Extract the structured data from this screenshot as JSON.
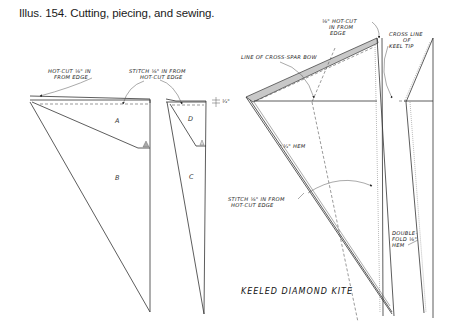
{
  "caption": "Illus. 154. Cutting, piecing, and sewing.",
  "left_diagram": {
    "labels": {
      "hot_cut_1": "HOT-CUT ⅛\" IN",
      "hot_cut_2": "FROM EDGE",
      "stitch_1": "STITCH ⅛\" IN FROM",
      "stitch_2": "HOT-CUT EDGE",
      "dimension": "¼\""
    },
    "pieces": {
      "a": "A",
      "b": "B",
      "c": "C",
      "d": "D"
    }
  },
  "right_diagram": {
    "title": "KEELED DIAMOND KITE",
    "labels": {
      "hot_cut_1": "⅛\" HOT-CUT",
      "hot_cut_2": "IN FROM",
      "hot_cut_3": "EDGE",
      "cross_spar": "LINE OF CROSS-SPAR BOW",
      "cross_line_1": "CROSS LINE",
      "cross_line_2": "OF",
      "cross_line_3": "KEEL TIP",
      "hem": "¼\" HEM",
      "stitch_1": "STITCH ⅛\" IN FROM",
      "stitch_2": "HOT-CUT EDGE",
      "double_1": "DOUBLE-",
      "double_2": "FOLD ⅛\"",
      "double_3": "HEM"
    }
  }
}
